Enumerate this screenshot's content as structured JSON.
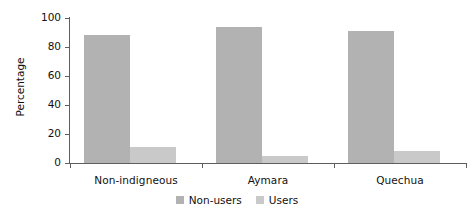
{
  "chart_data": {
    "type": "bar",
    "title": "",
    "xlabel": "",
    "ylabel": "Percentage",
    "ylim": [
      0,
      100
    ],
    "yticks": [
      0,
      20,
      40,
      60,
      80,
      100
    ],
    "ytick_labels": [
      "0",
      "20",
      "40",
      "60",
      "80",
      "100"
    ],
    "grid": false,
    "legend_position": "bottom-center",
    "categories": [
      "Non-indigneous",
      "Aymara",
      "Quechua"
    ],
    "series": [
      {
        "name": "Non-users",
        "color": "#b2b2b2",
        "values": [
          88,
          94,
          91
        ]
      },
      {
        "name": "Users",
        "color": "#c9c9c9",
        "values": [
          11,
          5,
          8
        ]
      }
    ]
  },
  "axes": {
    "y_title": "Percentage"
  },
  "legend": {
    "items": [
      {
        "label": "Non-users",
        "color": "#b2b2b2"
      },
      {
        "label": "Users",
        "color": "#c9c9c9"
      }
    ]
  },
  "colors": {
    "axis": "#5e5e5e",
    "text": "#111111",
    "background": "#ffffff",
    "nonusers": "#b2b2b2",
    "users": "#c9c9c9"
  }
}
